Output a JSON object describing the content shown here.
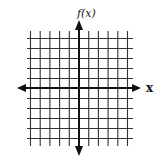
{
  "diagram": {
    "type": "coordinate-grid",
    "y_axis_label": "f(x)",
    "x_axis_label": "x",
    "grid": {
      "vertical_lines": 11,
      "horizontal_lines": 11,
      "x_origin_index": 5,
      "y_origin_index": 5,
      "line_color": "#333333",
      "axis_color": "#111111"
    },
    "arrows": [
      "left",
      "right",
      "up",
      "down"
    ]
  }
}
